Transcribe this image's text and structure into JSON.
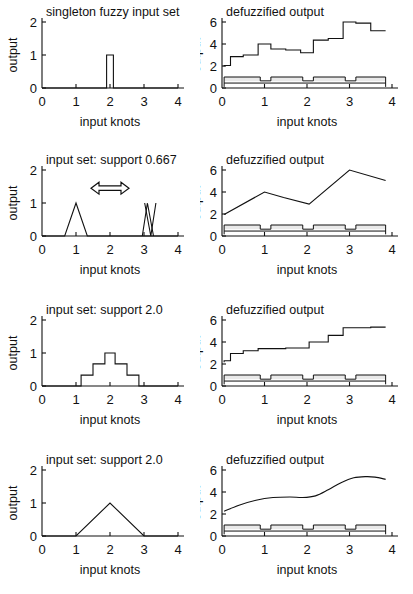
{
  "figure": {
    "kind": "multi-panel-line-chart-figure",
    "rows": 4,
    "cols": 2,
    "background": "#ffffff",
    "ink": "#111111",
    "band_color": "#e9e9e9"
  },
  "axes": {
    "xlabel": "input knots",
    "ylabel": "output",
    "x_ticks": [
      "0",
      "1",
      "2",
      "3",
      "4"
    ],
    "x_tick_values": [
      0,
      1,
      2,
      3,
      4
    ],
    "xlim": [
      0,
      4
    ],
    "left_y_ticks": [
      "0",
      "1",
      "2"
    ],
    "left_y_tick_values": [
      0,
      1,
      2
    ],
    "left_ylim": [
      0,
      2
    ],
    "right_y_ticks": [
      "0",
      "2",
      "4",
      "6"
    ],
    "right_y_tick_values": [
      0,
      2,
      4,
      6
    ],
    "right_ylim": [
      0,
      6
    ]
  },
  "titles": {
    "row1_left": "singleton fuzzy input set",
    "row1_right": "defuzzified output",
    "row2_left": "input set: support 0.667",
    "row2_right": "defuzzified output",
    "row3_left": "input set: support 2.0",
    "row3_right": "defuzzified output",
    "row4_left": "input set: support 2.0",
    "row4_right": "defuzzified output"
  },
  "annotations": {
    "row2_left_arrow": "left-right-double-arrow"
  },
  "chart_data": [
    {
      "id": "row1-left",
      "type": "line",
      "title": "singleton fuzzy input set",
      "xlabel": "input knots",
      "ylabel": "output",
      "xlim": [
        0,
        4
      ],
      "ylim": [
        0,
        2
      ],
      "xticks": [
        0,
        1,
        2,
        3,
        4
      ],
      "yticks": [
        0,
        1,
        2
      ],
      "grid": false,
      "legend": "none",
      "series": [
        {
          "name": "singleton membership",
          "x": [
            0,
            1.9,
            1.9,
            2.1,
            2.1,
            4
          ],
          "y": [
            0,
            0,
            1,
            1,
            0,
            0
          ]
        }
      ]
    },
    {
      "id": "row1-right",
      "type": "line",
      "title": "defuzzified output",
      "xlabel": "input knots",
      "ylabel": "output",
      "xlim": [
        0,
        4
      ],
      "ylim": [
        0,
        6
      ],
      "xticks": [
        0,
        1,
        2,
        3,
        4
      ],
      "yticks": [
        0,
        2,
        4,
        6
      ],
      "grid": false,
      "legend": "none",
      "series": [
        {
          "name": "defuzzified staircase",
          "x": [
            0.05,
            0.05,
            0.2,
            0.2,
            0.5,
            0.5,
            0.85,
            0.85,
            1.15,
            1.15,
            1.5,
            1.5,
            1.85,
            1.85,
            2.15,
            2.15,
            2.5,
            2.5,
            2.85,
            2.85,
            3.15,
            3.15,
            3.5,
            3.5,
            3.85
          ],
          "y": [
            1.95,
            2.05,
            2.05,
            2.85,
            2.85,
            3.0,
            3.0,
            4.0,
            4.0,
            3.55,
            3.55,
            3.45,
            3.45,
            3.2,
            3.2,
            4.35,
            4.35,
            4.5,
            4.5,
            6.0,
            6.0,
            5.9,
            5.9,
            5.2,
            5.2
          ]
        },
        {
          "name": "mf-upper-pulse",
          "x": [
            0.05,
            0.05,
            0.9,
            0.9,
            1.15,
            1.15,
            1.9,
            1.9,
            2.15,
            2.15,
            2.9,
            2.9,
            3.15,
            3.15,
            3.85,
            3.85
          ],
          "y": [
            0.1,
            1.0,
            1.0,
            0.65,
            0.65,
            1.0,
            1.0,
            0.65,
            0.65,
            1.0,
            1.0,
            0.65,
            0.65,
            1.0,
            1.0,
            0.1
          ]
        },
        {
          "name": "mf-lower-band",
          "x": [
            0.05,
            3.85
          ],
          "y": [
            0.45,
            0.45
          ]
        }
      ]
    },
    {
      "id": "row2-left",
      "type": "line",
      "title": "input set: support 0.667",
      "xlabel": "input knots",
      "ylabel": "output",
      "xlim": [
        0,
        4
      ],
      "ylim": [
        0,
        2
      ],
      "xticks": [
        0,
        1,
        2,
        3,
        4
      ],
      "yticks": [
        0,
        1,
        2
      ],
      "grid": false,
      "legend": "none",
      "annotation": "double arrow at x=2, y=1.5",
      "series": [
        {
          "name": "triangle at 1",
          "x": [
            0,
            0.667,
            1.0,
            1.333,
            4
          ],
          "y": [
            0,
            0,
            1,
            0,
            0
          ]
        },
        {
          "name": "triangle pair near 3",
          "x": [
            2.95,
            3.1,
            3.28
          ],
          "y": [
            0,
            1,
            0
          ]
        },
        {
          "name": "triangle pair near 3b",
          "x": [
            3.02,
            3.2,
            3.35
          ],
          "y": [
            1,
            0,
            1
          ]
        }
      ]
    },
    {
      "id": "row2-right",
      "type": "line",
      "title": "defuzzified output",
      "xlabel": "input knots",
      "ylabel": "output",
      "xlim": [
        0,
        4
      ],
      "ylim": [
        0,
        6
      ],
      "xticks": [
        0,
        1,
        2,
        3,
        4
      ],
      "yticks": [
        0,
        2,
        4,
        6
      ],
      "grid": false,
      "legend": "none",
      "series": [
        {
          "name": "defuzzified piecewise-linear",
          "x": [
            0.05,
            1.0,
            1.45,
            2.05,
            3.0,
            3.85
          ],
          "y": [
            1.95,
            4.0,
            3.5,
            2.9,
            6.0,
            5.05
          ]
        },
        {
          "name": "mf-upper-pulse",
          "x": [
            0.05,
            0.05,
            0.9,
            0.9,
            1.15,
            1.15,
            1.9,
            1.9,
            2.15,
            2.15,
            2.9,
            2.9,
            3.15,
            3.15,
            3.85,
            3.85
          ],
          "y": [
            0.15,
            1.0,
            1.0,
            0.62,
            0.62,
            1.0,
            1.0,
            0.62,
            0.62,
            1.0,
            1.0,
            0.62,
            0.62,
            1.0,
            1.0,
            0.15
          ]
        },
        {
          "name": "mf-lower-band",
          "x": [
            0.05,
            3.85
          ],
          "y": [
            0.45,
            0.45
          ]
        }
      ]
    },
    {
      "id": "row3-left",
      "type": "line",
      "title": "input set: support 2.0",
      "xlabel": "input knots",
      "ylabel": "output",
      "xlim": [
        0,
        4
      ],
      "ylim": [
        0,
        2
      ],
      "xticks": [
        0,
        1,
        2,
        3,
        4
      ],
      "yticks": [
        0,
        1,
        2
      ],
      "grid": false,
      "legend": "none",
      "series": [
        {
          "name": "staircase trapezoid",
          "x": [
            0,
            1.15,
            1.15,
            1.5,
            1.5,
            1.85,
            1.85,
            2.15,
            2.15,
            2.5,
            2.5,
            2.85,
            2.85,
            4
          ],
          "y": [
            0,
            0,
            0.33,
            0.33,
            0.67,
            0.67,
            1.0,
            1.0,
            0.67,
            0.67,
            0.33,
            0.33,
            0,
            0
          ]
        }
      ]
    },
    {
      "id": "row3-right",
      "type": "line",
      "title": "defuzzified output",
      "xlabel": "input knots",
      "ylabel": "output",
      "xlim": [
        0,
        4
      ],
      "ylim": [
        0,
        6
      ],
      "xticks": [
        0,
        1,
        2,
        3,
        4
      ],
      "yticks": [
        0,
        2,
        4,
        6
      ],
      "grid": false,
      "legend": "none",
      "series": [
        {
          "name": "defuzzified staircase",
          "x": [
            0.05,
            0.05,
            0.2,
            0.2,
            0.5,
            0.5,
            0.85,
            0.85,
            1.5,
            1.5,
            2.05,
            2.05,
            2.5,
            2.5,
            2.85,
            2.85,
            3.5,
            3.5,
            3.85
          ],
          "y": [
            2.15,
            2.3,
            2.3,
            2.95,
            2.95,
            3.2,
            3.2,
            3.4,
            3.4,
            3.45,
            3.45,
            4.0,
            4.0,
            4.6,
            4.6,
            5.3,
            5.3,
            5.35,
            5.35
          ]
        },
        {
          "name": "mf-upper-pulse",
          "x": [
            0.05,
            0.05,
            0.9,
            0.9,
            1.15,
            1.15,
            1.9,
            1.9,
            2.15,
            2.15,
            2.9,
            2.9,
            3.15,
            3.15,
            3.85,
            3.85
          ],
          "y": [
            0.15,
            1.0,
            1.0,
            0.62,
            0.62,
            1.0,
            1.0,
            0.62,
            0.62,
            1.0,
            1.0,
            0.62,
            0.62,
            1.0,
            1.0,
            0.15
          ]
        },
        {
          "name": "mf-lower-band",
          "x": [
            0.05,
            3.85
          ],
          "y": [
            0.45,
            0.45
          ]
        }
      ]
    },
    {
      "id": "row4-left",
      "type": "line",
      "title": "input set: support 2.0",
      "xlabel": "input knots",
      "ylabel": "output",
      "xlim": [
        0,
        4
      ],
      "ylim": [
        0,
        2
      ],
      "xticks": [
        0,
        1,
        2,
        3,
        4
      ],
      "yticks": [
        0,
        1,
        2
      ],
      "grid": false,
      "legend": "none",
      "series": [
        {
          "name": "triangle membership",
          "x": [
            0,
            1.0,
            2.0,
            3.0,
            4
          ],
          "y": [
            0,
            0,
            1,
            0,
            0
          ]
        }
      ]
    },
    {
      "id": "row4-right",
      "type": "line",
      "title": "defuzzified output",
      "xlabel": "input knots",
      "ylabel": "output",
      "xlim": [
        0,
        4
      ],
      "ylim": [
        0,
        6
      ],
      "xticks": [
        0,
        1,
        2,
        3,
        4
      ],
      "yticks": [
        0,
        2,
        4,
        6
      ],
      "grid": false,
      "legend": "none",
      "series": [
        {
          "name": "defuzzified smooth curve",
          "x": [
            0.05,
            0.4,
            0.8,
            1.2,
            1.6,
            1.9,
            2.2,
            2.5,
            2.8,
            3.1,
            3.4,
            3.6,
            3.85
          ],
          "y": [
            2.25,
            2.8,
            3.25,
            3.5,
            3.55,
            3.5,
            3.65,
            4.2,
            4.85,
            5.3,
            5.4,
            5.35,
            5.15
          ]
        },
        {
          "name": "mf-upper-pulse",
          "x": [
            0.05,
            0.05,
            0.9,
            0.9,
            1.15,
            1.15,
            1.9,
            1.9,
            2.15,
            2.15,
            2.9,
            2.9,
            3.15,
            3.15,
            3.85,
            3.85
          ],
          "y": [
            0.15,
            1.0,
            1.0,
            0.62,
            0.62,
            1.0,
            1.0,
            0.62,
            0.62,
            1.0,
            1.0,
            0.62,
            0.62,
            1.0,
            1.0,
            0.15
          ]
        },
        {
          "name": "mf-lower-band",
          "x": [
            0.05,
            3.85
          ],
          "y": [
            0.45,
            0.45
          ]
        }
      ]
    }
  ]
}
